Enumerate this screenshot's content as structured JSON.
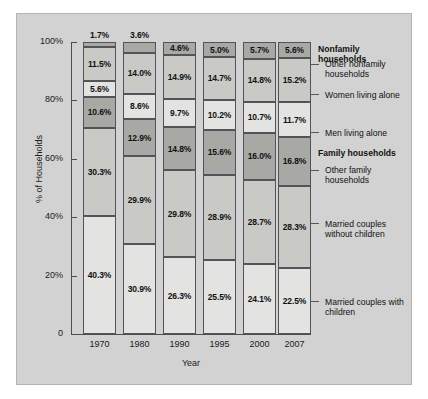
{
  "chart_data": {
    "type": "bar",
    "subtype": "stacked-100-percent",
    "title": "",
    "xlabel": "Year",
    "ylabel": "% of Households",
    "categories": [
      "1970",
      "1980",
      "1990",
      "1995",
      "2000",
      "2007"
    ],
    "ylim": [
      0,
      100
    ],
    "ytick_labels": [
      "0",
      "20%",
      "40%",
      "60%",
      "80%",
      "100%"
    ],
    "ytick_values": [
      0,
      20,
      40,
      60,
      80,
      100
    ],
    "grid": false,
    "legend_position": "right-callouts",
    "group_headings": [
      "Nonfamily households",
      "Family households"
    ],
    "series": [
      {
        "name": "Married couples with children",
        "group": "Family households",
        "color": "#e3e3e1",
        "values": [
          40.3,
          30.9,
          26.3,
          25.5,
          24.1,
          22.5
        ],
        "labels": [
          "40.3%",
          "30.9%",
          "26.3%",
          "25.5%",
          "24.1%",
          "22.5%"
        ]
      },
      {
        "name": "Married couples without children",
        "group": "Family households",
        "color": "#c9c9c6",
        "values": [
          30.3,
          29.9,
          29.8,
          28.9,
          28.7,
          28.3
        ],
        "labels": [
          "30.3%",
          "29.9%",
          "29.8%",
          "28.9%",
          "28.7%",
          "28.3%"
        ]
      },
      {
        "name": "Other family households",
        "group": "Family households",
        "color": "#a8a8a5",
        "values": [
          10.6,
          12.9,
          14.8,
          15.6,
          16.0,
          16.8
        ],
        "labels": [
          "10.6%",
          "12.9%",
          "14.8%",
          "15.6%",
          "16.0%",
          "16.8%"
        ]
      },
      {
        "name": "Men living alone",
        "group": "Nonfamily households",
        "color": "#e3e3e1",
        "values": [
          5.6,
          8.6,
          9.7,
          10.2,
          10.7,
          11.7
        ],
        "labels": [
          "5.6%",
          "8.6%",
          "9.7%",
          "10.2%",
          "10.7%",
          "11.7%"
        ]
      },
      {
        "name": "Women living alone",
        "group": "Nonfamily households",
        "color": "#c9c9c6",
        "values": [
          11.5,
          14.0,
          14.9,
          14.7,
          14.8,
          15.2
        ],
        "labels": [
          "11.5%",
          "14.0%",
          "14.9%",
          "14.7%",
          "14.8%",
          "15.2%"
        ]
      },
      {
        "name": "Other nonfamily households",
        "group": "Nonfamily households",
        "color": "#a8a8a5",
        "values": [
          1.7,
          3.6,
          4.6,
          5.0,
          5.7,
          5.6
        ],
        "labels": [
          "1.7%",
          "3.6%",
          "4.6%",
          "5.0%",
          "5.7%",
          "5.6%"
        ]
      }
    ]
  },
  "axes": {
    "y_title": "% of Households",
    "x_title": "Year",
    "y_ticks": [
      {
        "label": "100%",
        "value": 100
      },
      {
        "label": "80%",
        "value": 80
      },
      {
        "label": "60%",
        "value": 60
      },
      {
        "label": "40%",
        "value": 40
      },
      {
        "label": "20%",
        "value": 20
      },
      {
        "label": "0",
        "value": 0
      }
    ],
    "x_ticks": [
      "1970",
      "1980",
      "1990",
      "1995",
      "2000",
      "2007"
    ]
  },
  "callouts": [
    {
      "key": "nonfamily_head",
      "text": "Nonfamily households",
      "heading": true
    },
    {
      "key": "other_nonfamily",
      "text": "Other nonfamily households",
      "heading": false
    },
    {
      "key": "women_alone",
      "text": "Women living alone",
      "heading": false
    },
    {
      "key": "men_alone",
      "text": "Men living alone",
      "heading": false
    },
    {
      "key": "family_head",
      "text": "Family households",
      "heading": true
    },
    {
      "key": "other_family",
      "text": "Other family households",
      "heading": false
    },
    {
      "key": "married_without",
      "text": "Married couples without children",
      "heading": false
    },
    {
      "key": "married_with",
      "text": "Married couples with children",
      "heading": false
    }
  ],
  "colors": {
    "panel_background": "#d2d2d2",
    "segment_light": "#e3e3e1",
    "segment_medium": "#c9c9c6",
    "segment_dark": "#a8a8a5",
    "axis": "#4d4d4d",
    "text": "#111111"
  }
}
